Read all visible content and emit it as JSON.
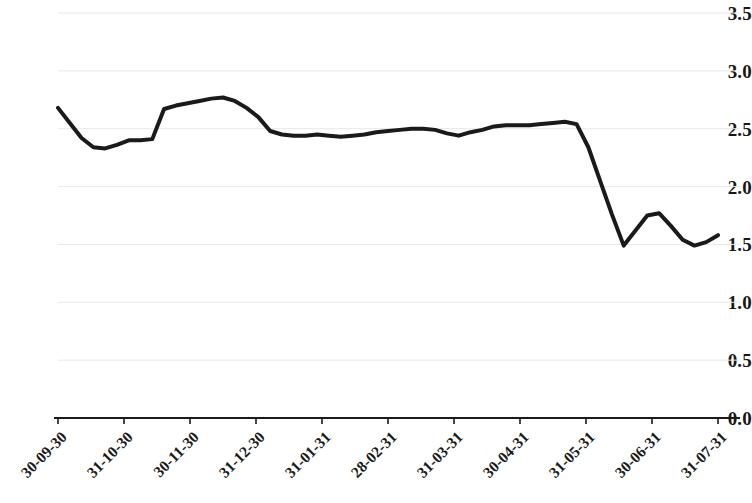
{
  "chart_data": {
    "type": "line",
    "title": "",
    "subtitle": "",
    "xlabel": "",
    "ylabel": "",
    "ylim": [
      0.0,
      3.5
    ],
    "grid": true,
    "grid_axis": "y",
    "legend": false,
    "legend_position": "none",
    "line_color": "#1a1a1a",
    "line_width": 4,
    "background_color": "#ffffff",
    "gridline_color": "#e8e8e8",
    "axis_color": "#1a1a1a",
    "ytick_labels": [
      "3.5",
      "3.0",
      "2.5",
      "2.0",
      "1.5",
      "1.0",
      "0.5",
      "0.0"
    ],
    "ytick_values": [
      3.5,
      3.0,
      2.5,
      2.0,
      1.5,
      1.0,
      0.5,
      0.0
    ],
    "xtick_labels": [
      "30-09-30",
      "31-10-30",
      "30-11-30",
      "31-12-30",
      "31-01-31",
      "28-02-31",
      "31-03-31",
      "30-04-31",
      "31-05-31",
      "30-06-31",
      "31-07-31"
    ],
    "xtick_label_rotation": -45,
    "series": [
      {
        "name": "series-1",
        "color": "#1a1a1a",
        "values": [
          2.68,
          2.55,
          2.42,
          2.34,
          2.33,
          2.36,
          2.4,
          2.4,
          2.41,
          2.67,
          2.7,
          2.72,
          2.74,
          2.76,
          2.77,
          2.74,
          2.68,
          2.6,
          2.48,
          2.45,
          2.44,
          2.44,
          2.45,
          2.44,
          2.43,
          2.44,
          2.45,
          2.47,
          2.48,
          2.49,
          2.5,
          2.5,
          2.49,
          2.46,
          2.44,
          2.47,
          2.49,
          2.52,
          2.53,
          2.53,
          2.53,
          2.54,
          2.55,
          2.56,
          2.54,
          2.34,
          2.05,
          1.76,
          1.49,
          1.62,
          1.75,
          1.77,
          1.66,
          1.54,
          1.49,
          1.52,
          1.58
        ]
      }
    ],
    "x_index_count": 57,
    "value_min": 1.49,
    "value_max": 2.77,
    "value_first": 2.68,
    "value_last": 1.58
  }
}
